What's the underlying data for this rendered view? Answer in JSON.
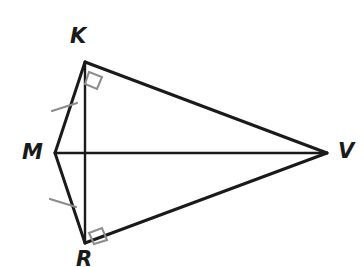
{
  "figure": {
    "kind": "geometry-diagram",
    "background_color": "#ffffff",
    "stroke_color": "#1a1a1a",
    "mark_color": "#8c8c8c",
    "canvas": {
      "width": 364,
      "height": 267
    },
    "vertices": [
      {
        "id": "K",
        "label": "K",
        "x": 85,
        "y": 62,
        "label_x": 70,
        "label_y": 26
      },
      {
        "id": "M",
        "label": "M",
        "x": 55,
        "y": 153,
        "label_x": 22,
        "label_y": 142
      },
      {
        "id": "V",
        "label": "V",
        "x": 327,
        "y": 153,
        "label_x": 338,
        "label_y": 141
      },
      {
        "id": "R",
        "label": "R",
        "x": 85,
        "y": 243,
        "label_x": 76,
        "label_y": 249
      }
    ],
    "segments": [
      {
        "id": "MK",
        "from": "M",
        "to": "K",
        "x1": 55,
        "y1": 153,
        "x2": 85,
        "y2": 62,
        "width": 3
      },
      {
        "id": "MR",
        "from": "M",
        "to": "R",
        "x1": 55,
        "y1": 153,
        "x2": 85,
        "y2": 243,
        "width": 3
      },
      {
        "id": "KV",
        "from": "K",
        "to": "V",
        "x1": 85,
        "y1": 62,
        "x2": 327,
        "y2": 153,
        "width": 3
      },
      {
        "id": "RV",
        "from": "R",
        "to": "V",
        "x1": 85,
        "y1": 243,
        "x2": 327,
        "y2": 153,
        "width": 3
      },
      {
        "id": "KR",
        "from": "K",
        "to": "R",
        "x1": 85,
        "y1": 62,
        "x2": 85,
        "y2": 243,
        "width": 2.4
      },
      {
        "id": "MV",
        "from": "M",
        "to": "V",
        "x1": 55,
        "y1": 153,
        "x2": 327,
        "y2": 153,
        "width": 2.4
      }
    ],
    "right_angle_marks": [
      {
        "id": "right-angle-K",
        "at": "K",
        "points": "89,72 102,77 97,89 85,84",
        "width": 2
      },
      {
        "id": "right-angle-R",
        "at": "R",
        "points": "89,233 102,228 107,240 94,244",
        "width": 2
      }
    ],
    "tick_marks": [
      {
        "id": "tick-MK",
        "on": "MK",
        "x1": 52,
        "y1": 111,
        "x2": 77,
        "y2": 103,
        "width": 2.2
      },
      {
        "id": "tick-MR",
        "on": "MR",
        "x1": 50,
        "y1": 199,
        "x2": 76,
        "y2": 207,
        "width": 2.2
      }
    ]
  }
}
